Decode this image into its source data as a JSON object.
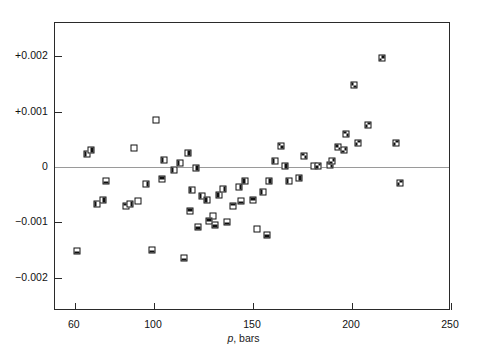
{
  "legend": {
    "title": "Keyes, Smith, and Gerry",
    "entries": [
      {
        "label": "306–313°",
        "marker": "open-square",
        "style": "m0"
      },
      {
        "label": "320–322°",
        "marker": "bottom-half-filled",
        "style": "m1"
      },
      {
        "label": "330–332.50°",
        "marker": "top-half-filled",
        "style": "m2"
      },
      {
        "label": "340–344.50°",
        "marker": "left-half-filled",
        "style": "m3"
      },
      {
        "label": "350–357.50°",
        "marker": "right-half-filled",
        "style": "m4"
      },
      {
        "label": "360–364.50°",
        "marker": "diagonal-tl-br-filled",
        "style": "m5"
      },
      {
        "label": "370–375°",
        "marker": "diagonal-bl-tr-filled",
        "style": "m6"
      }
    ]
  },
  "annotation": {
    "numerator_left": "p",
    "numerator_sub_left": "obs",
    "numerator_op": "−",
    "numerator_right": "p",
    "numerator_sub_right": "c",
    "denominator": "p",
    "denominator_sub": "c",
    "plain": "(p_obs − p_c) / p_c"
  },
  "chart_data": {
    "type": "scatter",
    "title": "",
    "xlabel": "p, bars",
    "ylabel": "(p_obs − p_c) / p_c",
    "xlim": [
      50,
      250
    ],
    "ylim": [
      -0.0026,
      0.0026
    ],
    "xticks": [
      60,
      100,
      150,
      200,
      250
    ],
    "xtick_labels": [
      "60",
      "100",
      "150",
      "200",
      "250"
    ],
    "yticks": [
      0.002,
      0.001,
      0,
      -0.001,
      -0.002
    ],
    "ytick_labels": [
      "+0.002",
      "+0.001",
      "0",
      "−0.001",
      "−0.002"
    ],
    "grid": false,
    "zero_line": true,
    "legend_position": "upper-left",
    "series": [
      {
        "name": "306–313°",
        "style": "m0",
        "points": [
          [
            90,
            0.00035
          ],
          [
            101,
            0.00085
          ],
          [
            92,
            -0.00062
          ],
          [
            130,
            -0.00088
          ],
          [
            152,
            -0.00112
          ]
        ]
      },
      {
        "name": "320–322°",
        "style": "m1",
        "points": [
          [
            61,
            -0.00152
          ],
          [
            76,
            -0.00026
          ],
          [
            99,
            -0.0015
          ],
          [
            115,
            -0.00165
          ],
          [
            122,
            -0.00108
          ],
          [
            131,
            -0.00104
          ],
          [
            137,
            -0.001
          ],
          [
            144,
            -0.00062
          ],
          [
            157,
            -0.00122
          ]
        ]
      },
      {
        "name": "330–332.50°",
        "style": "m2",
        "points": [
          [
            86,
            -0.0007
          ],
          [
            104,
            -0.00022
          ],
          [
            118,
            -0.0008
          ],
          [
            128,
            -0.00098
          ],
          [
            140,
            -0.0007
          ],
          [
            150,
            -0.0006
          ]
        ]
      },
      {
        "name": "340–344.50°",
        "style": "m3",
        "points": [
          [
            66,
            0.00024
          ],
          [
            71,
            -0.00066
          ],
          [
            105,
            0.00012
          ],
          [
            110,
            -6e-05
          ],
          [
            113,
            8e-05
          ],
          [
            119,
            -0.00042
          ],
          [
            124,
            -0.00052
          ],
          [
            127,
            -0.0006
          ],
          [
            133,
            -0.0005
          ],
          [
            146,
            -0.00026
          ],
          [
            155,
            -0.00046
          ],
          [
            161,
            0.0001
          ],
          [
            168,
            -0.00026
          ]
        ]
      },
      {
        "name": "350–357.50°",
        "style": "m4",
        "points": [
          [
            68,
            0.0003
          ],
          [
            74,
            -0.0006
          ],
          [
            88,
            -0.00066
          ],
          [
            96,
            -0.0003
          ],
          [
            117,
            0.00026
          ],
          [
            121,
            -2e-05
          ],
          [
            135,
            -0.0004
          ],
          [
            143,
            -0.00036
          ],
          [
            158,
            -0.00026
          ],
          [
            166,
            2e-05
          ],
          [
            173,
            -0.0002
          ],
          [
            181,
            2e-05
          ]
        ]
      },
      {
        "name": "360–364.50°",
        "style": "m5",
        "points": [
          [
            164,
            0.00038
          ],
          [
            176,
            0.0002
          ],
          [
            189,
            4e-05
          ],
          [
            193,
            0.00036
          ],
          [
            197,
            0.0006
          ],
          [
            201,
            0.00148
          ]
        ]
      },
      {
        "name": "370–375°",
        "style": "m6",
        "points": [
          [
            183,
            2e-05
          ],
          [
            190,
            0.0001
          ],
          [
            196,
            0.0003
          ],
          [
            203,
            0.00044
          ],
          [
            208,
            0.00076
          ],
          [
            215,
            0.00196
          ],
          [
            222,
            0.00044
          ],
          [
            224,
            -0.00028
          ]
        ]
      }
    ]
  }
}
